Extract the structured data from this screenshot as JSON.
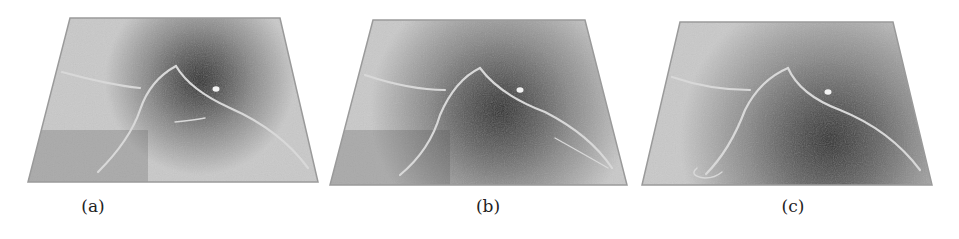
{
  "figure": {
    "panels": [
      {
        "id": "a",
        "caption": "(a)",
        "caption_x": 93,
        "quad": [
          [
            70,
            18
          ],
          [
            280,
            18
          ],
          [
            318,
            182
          ],
          [
            28,
            182
          ]
        ],
        "dark_center": [
          200,
          80
        ],
        "dark_radius": 95,
        "curves": [
          "M 62 72 Q 110 85 140 88",
          "M 98 172 Q 130 140 140 110 Q 150 80 176 66",
          "M 176 66 Q 190 90 230 108 Q 280 130 308 168",
          "M 175 122 Q 195 120 205 118"
        ],
        "marker": [
          216,
          89
        ]
      },
      {
        "id": "b",
        "caption": "(b)",
        "caption_x": 488,
        "quad": [
          [
            373,
            20
          ],
          [
            585,
            20
          ],
          [
            627,
            185
          ],
          [
            330,
            185
          ]
        ],
        "dark_center": [
          500,
          110
        ],
        "dark_radius": 130,
        "curves": [
          "M 365 75 Q 410 90 445 90",
          "M 400 175 Q 430 150 440 115 Q 455 80 480 68",
          "M 480 68 Q 500 95 545 112 Q 590 135 612 168",
          "M 555 138 Q 580 152 608 168"
        ],
        "marker": [
          520,
          90
        ]
      },
      {
        "id": "c",
        "caption": "(c)",
        "caption_x": 793,
        "quad": [
          [
            680,
            22
          ],
          [
            893,
            22
          ],
          [
            932,
            185
          ],
          [
            642,
            185
          ]
        ],
        "dark_center": [
          830,
          140
        ],
        "dark_radius": 150,
        "curves": [
          "M 672 77 Q 710 90 750 90",
          "M 706 174 Q 730 150 745 110 Q 760 80 788 68",
          "M 788 68 Q 800 95 840 110 Q 890 130 920 170",
          "M 697 168 Q 688 176 705 178 Q 715 178 722 172"
        ],
        "marker": [
          828,
          92
        ]
      }
    ],
    "colors": {
      "light_surface": "#c9c9c9",
      "mid_surface": "#8a8a8a",
      "dark_region": "#2e2e2e",
      "curve": "#d8d8d8",
      "edge": "#9a9a9a",
      "caption": "#222222"
    }
  }
}
